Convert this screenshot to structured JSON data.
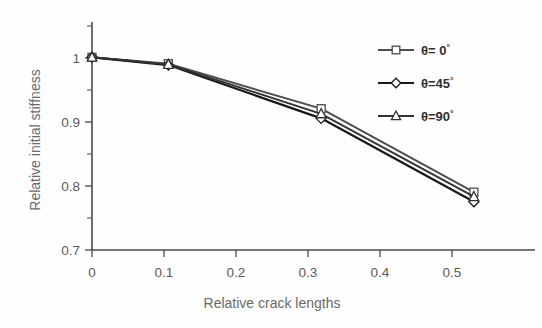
{
  "chart_data": {
    "type": "line",
    "title": "",
    "xlabel": "Relative crack lengths",
    "ylabel": "Relative initial stiffness",
    "xlim": [
      0,
      0.58
    ],
    "ylim": [
      0.7,
      1.055
    ],
    "grid": false,
    "legend_position": "top-right",
    "x": [
      0,
      0.1,
      0.3,
      0.5
    ],
    "xticks": [
      "0",
      "0.1",
      "0.2",
      "0.3",
      "0.4",
      "0.5"
    ],
    "xtick_values": [
      0,
      0.1,
      0.2,
      0.3,
      0.4,
      0.5
    ],
    "yticks": [
      "0.7",
      "0.8",
      "0.9",
      "1"
    ],
    "ytick_values": [
      0.7,
      0.8,
      0.9,
      1.0
    ],
    "yminor_values": [
      0.75,
      0.85,
      0.95,
      1.05
    ],
    "series": [
      {
        "name": "θ= 0°",
        "marker": "square",
        "color": "#4d4d4d",
        "values": [
          1.0,
          0.99,
          0.92,
          0.79
        ]
      },
      {
        "name": "θ=45°",
        "marker": "diamond",
        "color": "#1a1a1a",
        "values": [
          1.0,
          0.988,
          0.905,
          0.775
        ]
      },
      {
        "name": "θ=90°",
        "marker": "triangle",
        "color": "#333333",
        "values": [
          1.0,
          0.989,
          0.912,
          0.783
        ]
      }
    ]
  },
  "legend": {
    "items": [
      {
        "label_base": "θ= 0",
        "label_sup": "°",
        "marker": "square"
      },
      {
        "label_base": "θ=45",
        "label_sup": "°",
        "marker": "diamond"
      },
      {
        "label_base": "θ=90",
        "label_sup": "°",
        "marker": "triangle"
      }
    ]
  },
  "axes": {
    "x_title": "Relative crack lengths",
    "y_title": "Relative initial stiffness"
  }
}
